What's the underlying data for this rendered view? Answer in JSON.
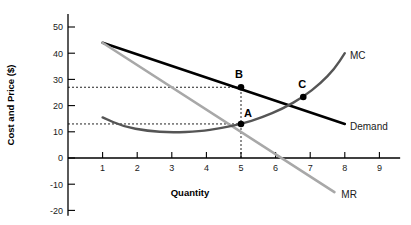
{
  "chart_data": {
    "type": "line",
    "title": "",
    "xlabel": "Quantity",
    "ylabel": "Cost and Price ($)",
    "xlim": [
      0,
      9.6
    ],
    "ylim": [
      -22,
      55
    ],
    "xticks": [
      "1",
      "2",
      "3",
      "4",
      "5",
      "6",
      "7",
      "8",
      "9"
    ],
    "xtick_values": [
      1,
      2,
      3,
      4,
      5,
      6,
      7,
      8,
      9
    ],
    "yticks": [
      "50",
      "40",
      "30",
      "20",
      "10",
      "0",
      "-10",
      "-20"
    ],
    "ytick_values": [
      50,
      40,
      30,
      20,
      10,
      0,
      -10,
      -20
    ],
    "grid": false,
    "legend": "inline-labels",
    "series": [
      {
        "name": "Demand",
        "label": "Demand",
        "color": "#000000",
        "width": 2.6,
        "points": [
          [
            1,
            44
          ],
          [
            8,
            13
          ]
        ]
      },
      {
        "name": "MR",
        "label": "MR",
        "color": "#a8a8a8",
        "width": 2.6,
        "points": [
          [
            1,
            44
          ],
          [
            7.7,
            -13
          ]
        ]
      },
      {
        "name": "MC",
        "label": "MC",
        "color": "#555555",
        "width": 2.4,
        "points": [
          [
            1,
            15.5
          ],
          [
            1.6,
            12.0
          ],
          [
            2.3,
            10.3
          ],
          [
            3.0,
            9.7
          ],
          [
            3.8,
            10.2
          ],
          [
            4.4,
            11.3
          ],
          [
            5.0,
            13.0
          ],
          [
            5.6,
            15.4
          ],
          [
            6.2,
            18.8
          ],
          [
            6.8,
            23.3
          ],
          [
            7.3,
            28.5
          ],
          [
            7.7,
            34.0
          ],
          [
            8.0,
            40.0
          ]
        ]
      }
    ],
    "annotations": [
      {
        "label": "A",
        "x": 5,
        "y": 13,
        "marker": true,
        "label_dx": 7,
        "label_dy": -7
      },
      {
        "label": "B",
        "x": 5,
        "y": 27,
        "marker": true,
        "label_dx": -2,
        "label_dy": -9
      },
      {
        "label": "C",
        "x": 6.8,
        "y": 23.3,
        "marker": true,
        "label_dx": -1,
        "label_dy": -9
      }
    ],
    "guide_lines": [
      {
        "name": "price-B-horizontal",
        "type": "horizontal",
        "y": 27,
        "from_x": 0,
        "to_x": 5
      },
      {
        "name": "cost-A-horizontal",
        "type": "horizontal",
        "y": 13,
        "from_x": 0,
        "to_x": 5
      },
      {
        "name": "quantity-vertical",
        "type": "vertical",
        "x": 5,
        "from_y": 0,
        "to_y": 27
      }
    ],
    "series_label_positions": {
      "mc": {
        "x": 8.15,
        "y": 39
      },
      "demand": {
        "x": 8.15,
        "y": 12
      },
      "mr": {
        "x": 7.9,
        "y": -14
      }
    }
  }
}
